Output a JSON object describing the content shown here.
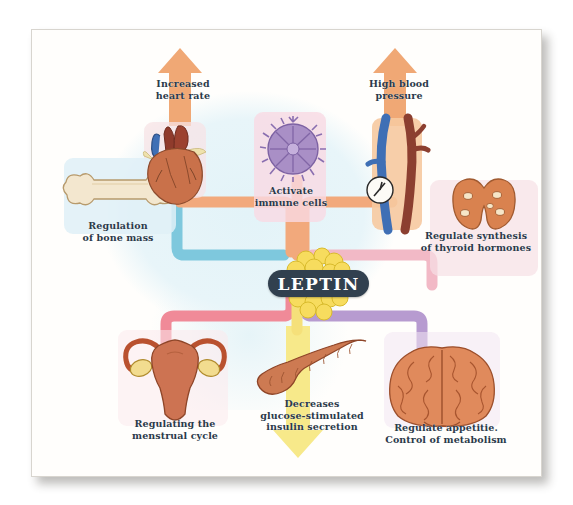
{
  "diagram": {
    "center_label": "LEPTIN",
    "title_hidden": "",
    "nodes": [
      {
        "id": "bone",
        "label": "Regulation\nof bone mass",
        "organ": "bone-icon",
        "pipe_color": "#7ec8dd",
        "plate_color": "#dff0f7",
        "position": "left"
      },
      {
        "id": "heart",
        "label": "Increased\nheart rate",
        "organ": "heart-icon",
        "pipe_color": "#f4b183",
        "plate_color": "#f7e3e6",
        "arrow": "up",
        "arrow_color": "#f0a875",
        "position": "top-left"
      },
      {
        "id": "immune",
        "label": "Activate\nimmune cells",
        "organ": "immune-cell-icon",
        "pipe_color": "#f0a0b4",
        "plate_color": "#f9d9e4",
        "position": "top-center"
      },
      {
        "id": "vessel",
        "label": "High blood\npressure",
        "organ": "blood-vessel-icon",
        "pipe_color": "#f4b183",
        "plate_color": "#f6c9a0",
        "arrow": "up",
        "arrow_color": "#f0a875",
        "position": "top-right"
      },
      {
        "id": "thyroid",
        "label": "Regulate synthesis\nof thyroid hormones",
        "organ": "thyroid-icon",
        "pipe_color": "#f2b9c6",
        "plate_color": "#f7dfe6",
        "position": "right"
      },
      {
        "id": "uterus",
        "label": "Regulating the\nmenstrual cycle",
        "organ": "uterus-icon",
        "pipe_color": "#f08a98",
        "plate_color": "#fbeaec",
        "position": "bottom-left"
      },
      {
        "id": "pancreas",
        "label": "Decreases\nglucose-stimulated\ninsulin secretion",
        "organ": "pancreas-icon",
        "pipe_color": "#f5e07a",
        "plate_color": "#fbf0b8",
        "arrow": "down",
        "arrow_color": "#f7e98a",
        "position": "bottom-center"
      },
      {
        "id": "brain",
        "label": "Regulate appetitie.\nControl of metabolism",
        "organ": "brain-icon",
        "pipe_color": "#b79bd0",
        "plate_color": "#f3e6f2",
        "position": "bottom-right"
      }
    ],
    "colors": {
      "leptin_pill": "#31404f",
      "leptin_text": "#ffffff",
      "label_text": "#2b3a4a",
      "fat_cell": "#f7dc5e",
      "background_wash": "#e3f3f8",
      "card": "#fffefc"
    }
  }
}
